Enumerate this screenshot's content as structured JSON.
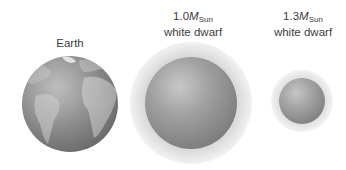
{
  "objects": [
    {
      "id": "earth",
      "label_line1": "Earth",
      "label_line2": "",
      "cx": 70,
      "cy": 104,
      "r": 48
    },
    {
      "id": "wd-1.0",
      "mass_prefix": "1.0",
      "mass_symbol": "M",
      "mass_subscript": "Sun",
      "label_line2": "white dwarf",
      "cx": 191,
      "cy": 103,
      "r": 46
    },
    {
      "id": "wd-1.3",
      "mass_prefix": "1.3",
      "mass_symbol": "M",
      "mass_subscript": "Sun",
      "label_line2": "white dwarf",
      "cx": 302,
      "cy": 101,
      "r": 23
    }
  ],
  "colors": {
    "background": "#ffffff",
    "text": "#3d3d3d",
    "earth_ocean": "#8a8a8a",
    "earth_land": "#b5b5b5",
    "dwarf_light": "#c4c4c4",
    "dwarf_dark": "#6e6e6e"
  }
}
